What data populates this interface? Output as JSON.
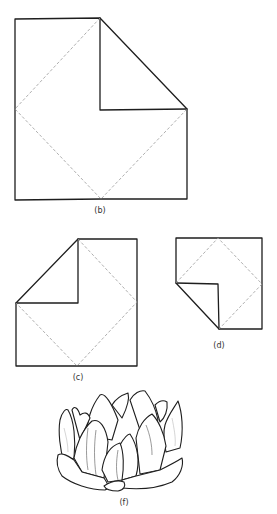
{
  "figures": [
    {
      "id": "b",
      "label": "(b)",
      "description": "square with top-right corner folded down to center"
    },
    {
      "id": "c",
      "label": "(c)",
      "description": "rectangle with top-left corner folded to center"
    },
    {
      "id": "d",
      "label": "(d)",
      "description": "small square with bottom-left corner folded to center"
    },
    {
      "id": "f",
      "label": "(f)",
      "description": "finished folded lotus flower"
    }
  ],
  "colors": {
    "line": "#1e1e1e",
    "dashed_crease": "#9a9a9a",
    "background": "#ffffff"
  }
}
